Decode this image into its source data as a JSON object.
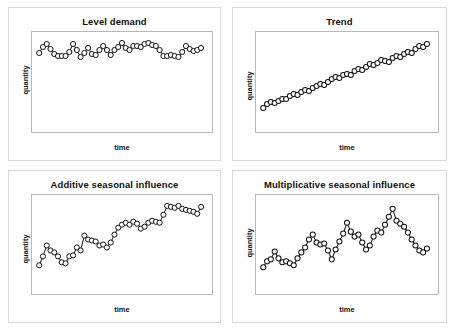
{
  "figure": {
    "background_color": "#ffffff",
    "panel_border_color": "#d9d9d9",
    "plot_border_color": "#b8b8b8",
    "line_color": "#111111",
    "marker_fill": "#ffffff"
  },
  "chart_data": [
    {
      "id": "level-demand",
      "type": "line",
      "title": "Level demand",
      "xlabel": "time",
      "ylabel": "quantity",
      "grid": false,
      "legend": null,
      "marker": "open-circle",
      "xlim": [
        0,
        44
      ],
      "ylim": [
        0,
        100
      ],
      "x": [
        0,
        1,
        2,
        3,
        4,
        5,
        6,
        7,
        8,
        9,
        10,
        11,
        12,
        13,
        14,
        15,
        16,
        17,
        18,
        19,
        20,
        21,
        22,
        23,
        24,
        25,
        26,
        27,
        28,
        29,
        30,
        31,
        32,
        33,
        34,
        35,
        36,
        37,
        38,
        39,
        40,
        41,
        42,
        43
      ],
      "values": [
        79,
        85,
        88,
        83,
        78,
        76,
        76,
        76,
        80,
        88,
        82,
        75,
        79,
        84,
        78,
        77,
        82,
        86,
        82,
        77,
        82,
        85,
        89,
        84,
        82,
        86,
        86,
        85,
        88,
        89,
        87,
        86,
        82,
        76,
        76,
        77,
        76,
        75,
        80,
        86,
        83,
        81,
        82,
        84
      ]
    },
    {
      "id": "trend",
      "type": "line",
      "title": "Trend",
      "xlabel": "time",
      "ylabel": "quantity",
      "grid": false,
      "legend": null,
      "marker": "open-circle",
      "xlim": [
        0,
        44
      ],
      "ylim": [
        0,
        100
      ],
      "x": [
        0,
        1,
        2,
        3,
        4,
        5,
        6,
        7,
        8,
        9,
        10,
        11,
        12,
        13,
        14,
        15,
        16,
        17,
        18,
        19,
        20,
        21,
        22,
        23,
        24,
        25,
        26,
        27,
        28,
        29,
        30,
        31,
        32,
        33,
        34,
        35,
        36,
        37,
        38,
        39,
        40,
        41,
        42,
        43
      ],
      "values": [
        24,
        28,
        30,
        29,
        31,
        33,
        33,
        36,
        38,
        37,
        40,
        42,
        41,
        44,
        46,
        48,
        47,
        50,
        53,
        55,
        54,
        57,
        58,
        57,
        61,
        63,
        62,
        65,
        68,
        67,
        69,
        72,
        71,
        70,
        74,
        76,
        75,
        78,
        80,
        79,
        83,
        86,
        85,
        88
      ]
    },
    {
      "id": "additive-seasonal-influence",
      "type": "line",
      "title": "Additive seasonal influence",
      "xlabel": "time",
      "ylabel": "quantity",
      "grid": false,
      "legend": null,
      "marker": "open-circle",
      "xlim": [
        0,
        44
      ],
      "ylim": [
        0,
        100
      ],
      "x": [
        0,
        1,
        2,
        3,
        4,
        5,
        6,
        7,
        8,
        9,
        10,
        11,
        12,
        13,
        14,
        15,
        16,
        17,
        18,
        19,
        20,
        21,
        22,
        23,
        24,
        25,
        26,
        27,
        28,
        29,
        30,
        31,
        32,
        33,
        34,
        35,
        36,
        37,
        38,
        39,
        40,
        41,
        42,
        43
      ],
      "values": [
        29,
        38,
        49,
        44,
        42,
        38,
        32,
        31,
        38,
        39,
        47,
        44,
        59,
        55,
        54,
        53,
        49,
        50,
        47,
        52,
        60,
        67,
        70,
        72,
        70,
        73,
        71,
        66,
        68,
        72,
        74,
        73,
        72,
        80,
        89,
        88,
        87,
        89,
        86,
        85,
        84,
        83,
        81,
        88
      ]
    },
    {
      "id": "multiplicative-seasonal-influence",
      "type": "line",
      "title": "Multiplicative seasonal influence",
      "xlabel": "time",
      "ylabel": "quantity",
      "grid": false,
      "legend": null,
      "marker": "open-circle",
      "xlim": [
        0,
        44
      ],
      "ylim": [
        0,
        100
      ],
      "x": [
        0,
        1,
        2,
        3,
        4,
        5,
        6,
        7,
        8,
        9,
        10,
        11,
        12,
        13,
        14,
        15,
        16,
        17,
        18,
        19,
        20,
        21,
        22,
        23,
        24,
        25,
        26,
        27,
        28,
        29,
        30,
        31,
        32,
        33,
        34,
        35,
        36,
        37,
        38,
        39,
        40,
        41,
        42,
        43
      ],
      "values": [
        27,
        33,
        35,
        43,
        36,
        32,
        33,
        31,
        29,
        36,
        42,
        47,
        55,
        60,
        52,
        50,
        51,
        44,
        35,
        45,
        53,
        61,
        72,
        63,
        58,
        60,
        52,
        45,
        49,
        58,
        64,
        62,
        70,
        78,
        86,
        74,
        71,
        68,
        62,
        55,
        49,
        44,
        42,
        46
      ]
    }
  ],
  "panels": {
    "top_left": {
      "title": "Level demand",
      "ylabel": "quantity",
      "xlabel": "time"
    },
    "top_right": {
      "title": "Trend",
      "ylabel": "quantity",
      "xlabel": "time"
    },
    "bottom_left": {
      "title": "Additive seasonal influence",
      "ylabel": "quantity",
      "xlabel": "time"
    },
    "bottom_right": {
      "title": "Multiplicative seasonal influence",
      "ylabel": "quantity",
      "xlabel": "time"
    }
  }
}
